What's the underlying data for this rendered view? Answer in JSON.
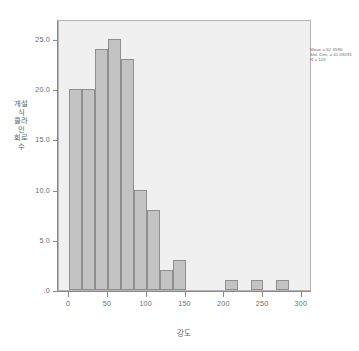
{
  "chart_data": {
    "type": "bar",
    "title": "",
    "subtitle": "",
    "xlabel": "강도",
    "ylabel": "개설식 클라인 회로 수",
    "xlim": [
      -13,
      313
    ],
    "ylim": [
      0,
      27
    ],
    "grid": false,
    "legend_position": "top-right",
    "bin_width": 16.7,
    "x_tick_labels": [
      "0",
      "50",
      "100",
      "150",
      "200",
      "250",
      "300"
    ],
    "x_tick_values": [
      0,
      50,
      100,
      150,
      200,
      250,
      300
    ],
    "y_tick_labels": [
      ".0",
      "5.0",
      "10.0",
      "15.0",
      "20.0",
      "25.0"
    ],
    "y_tick_values": [
      0,
      5,
      10,
      15,
      20,
      25
    ],
    "bins": [
      {
        "x0": 0.0,
        "x1": 16.7,
        "value": 20
      },
      {
        "x0": 16.7,
        "x1": 33.4,
        "value": 20
      },
      {
        "x0": 33.4,
        "x1": 50.1,
        "value": 24
      },
      {
        "x0": 50.1,
        "x1": 66.8,
        "value": 25
      },
      {
        "x0": 66.8,
        "x1": 83.5,
        "value": 23
      },
      {
        "x0": 83.5,
        "x1": 100.2,
        "value": 10
      },
      {
        "x0": 100.2,
        "x1": 116.9,
        "value": 8
      },
      {
        "x0": 116.9,
        "x1": 133.6,
        "value": 2
      },
      {
        "x0": 133.6,
        "x1": 150.3,
        "value": 3
      },
      {
        "x0": 200.4,
        "x1": 217.1,
        "value": 1
      },
      {
        "x0": 233.8,
        "x1": 250.5,
        "value": 1
      },
      {
        "x0": 267.2,
        "x1": 283.9,
        "value": 1
      }
    ],
    "values": [
      20,
      20,
      24,
      25,
      23,
      10,
      8,
      2,
      3,
      0,
      0,
      0,
      1,
      0,
      1,
      0,
      1
    ],
    "colors": {
      "bar_fill": "#c3c3c3",
      "bar_border": "#8f8f8f",
      "plot_background": "#f0f0f0",
      "plot_border": "#b5b5b5",
      "axis_line": "#8a8a8a",
      "tick_label": "#6a6a6a",
      "axis_title": "#5f5f5f",
      "annotation_text": "#6d6d6d",
      "figure_background": "#ffffff"
    }
  },
  "statistics": {
    "mean_label": "Mean = 62.3596",
    "stddev_label": "Std. Dev. = 41.09291",
    "n_label": "N = 125",
    "mean": 62.3596,
    "std_dev": 41.09291,
    "n": 125
  }
}
